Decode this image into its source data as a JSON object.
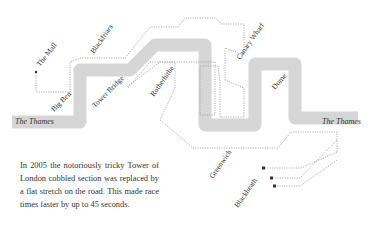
{
  "map": {
    "river_name_left": "The Thames",
    "river_name_right": "The Thames",
    "landmarks": [
      {
        "name": "The Mall"
      },
      {
        "name": "Big Ben"
      },
      {
        "name": "Blackfriars"
      },
      {
        "name": "Tower Bridge"
      },
      {
        "name": "Rotherhithe"
      },
      {
        "name": "Canary Wharf"
      },
      {
        "name": "Dome"
      },
      {
        "name": "Greenwich"
      },
      {
        "name": "Blackheath"
      }
    ],
    "colors": {
      "river": "#d6d6d6",
      "route": "#9a9a9a",
      "text": "#333333"
    }
  },
  "note": {
    "text": "In 2005 the notoriously tricky Tower of London cobbled section was replaced by a flat stretch on the road. This made race times faster by up to 45 seconds."
  }
}
